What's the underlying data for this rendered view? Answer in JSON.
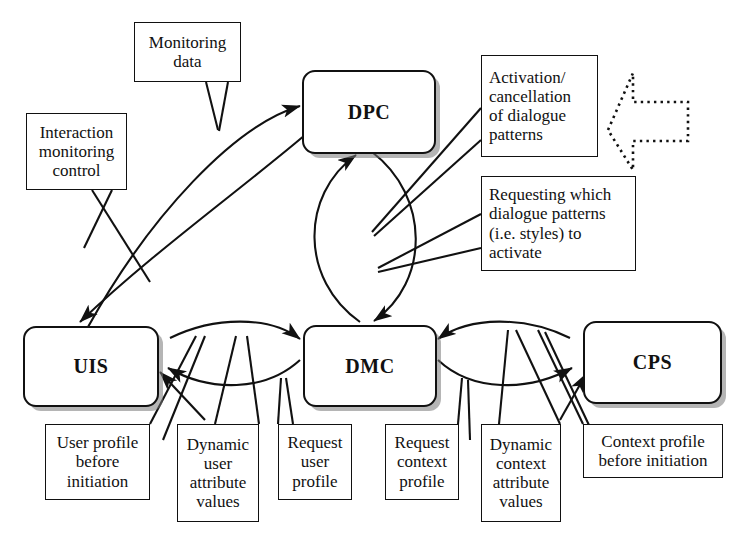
{
  "diagram": {
    "nodes": [
      {
        "id": "dpc",
        "label": "DPC"
      },
      {
        "id": "dmc",
        "label": "DMC"
      },
      {
        "id": "uis",
        "label": "UIS"
      },
      {
        "id": "cps",
        "label": "CPS"
      }
    ],
    "callouts": [
      {
        "id": "monitoring-data",
        "lines": [
          "Monitoring",
          "data"
        ]
      },
      {
        "id": "interaction-monitoring",
        "lines": [
          "Interaction",
          "monitoring",
          "control"
        ]
      },
      {
        "id": "activation-cancellation",
        "lines": [
          "Activation/",
          "cancellation",
          "of dialogue",
          "patterns"
        ]
      },
      {
        "id": "requesting-patterns",
        "lines": [
          "Requesting which",
          "dialogue patterns",
          "(i.e. styles) to",
          "activate"
        ]
      },
      {
        "id": "user-profile-before",
        "lines": [
          "User profile",
          "before",
          "initiation"
        ]
      },
      {
        "id": "dynamic-user-attr",
        "lines": [
          "Dynamic",
          "user",
          "attribute",
          "values"
        ]
      },
      {
        "id": "request-user-profile",
        "lines": [
          "Request",
          "user",
          "profile"
        ]
      },
      {
        "id": "request-context-profile",
        "lines": [
          "Request",
          "context",
          "profile"
        ]
      },
      {
        "id": "dynamic-context-attr",
        "lines": [
          "Dynamic",
          "context",
          "attribute",
          "values"
        ]
      },
      {
        "id": "context-profile-before",
        "lines": [
          "Context profile",
          "before initiation"
        ]
      }
    ],
    "shapes": [
      {
        "id": "external-input-arrow",
        "style": "dotted",
        "direction": "left"
      }
    ],
    "colors": {
      "stroke": "#111111",
      "background": "#ffffff",
      "node_shadow": "#787878"
    }
  }
}
